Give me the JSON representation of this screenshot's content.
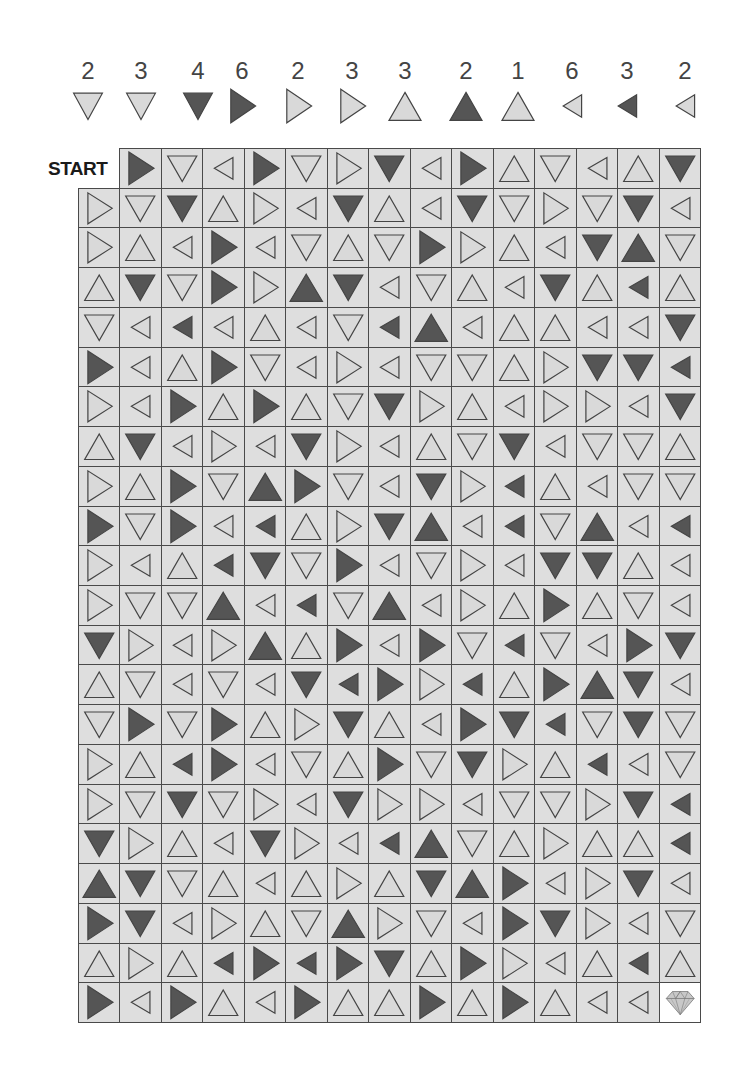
{
  "start_label": "START",
  "colors": {
    "light": "#d9d9d9",
    "dark": "#555555",
    "stroke": "#444444",
    "cell_bg": "#dedede",
    "grid_line": "#4a4a4a"
  },
  "legend": [
    {
      "count": "2",
      "dir": "D",
      "shade": "light"
    },
    {
      "count": "3",
      "dir": "D",
      "shade": "light"
    },
    {
      "count": "4",
      "dir": "D",
      "shade": "dark"
    },
    {
      "count": "6",
      "dir": "R",
      "shade": "dark"
    },
    {
      "count": "2",
      "dir": "R",
      "shade": "light"
    },
    {
      "count": "3",
      "dir": "R",
      "shade": "light"
    },
    {
      "count": "3",
      "dir": "U",
      "shade": "light"
    },
    {
      "count": "2",
      "dir": "U",
      "shade": "dark"
    },
    {
      "count": "1",
      "dir": "U",
      "shade": "light"
    },
    {
      "count": "6",
      "dir": "L",
      "shade": "light"
    },
    {
      "count": "3",
      "dir": "L",
      "shade": "dark"
    },
    {
      "count": "2",
      "dir": "L",
      "shade": "light"
    }
  ],
  "grid": {
    "columns": 15,
    "rows": [
      [
        "_",
        "Rd",
        "Dl",
        "Ll",
        "Rd",
        "Dl",
        "Rl",
        "Dd",
        "Ll",
        "Rd",
        "Ul",
        "Dl",
        "Ll",
        "Ul",
        "Dd"
      ],
      [
        "Rl",
        "Dl",
        "Dd",
        "Ul",
        "Rl",
        "Ll",
        "Dd",
        "Ul",
        "Ll",
        "Dd",
        "Dl",
        "Rl",
        "Dl",
        "Dd",
        "Ll"
      ],
      [
        "Rl",
        "Ul",
        "Ll",
        "Rd",
        "Ll",
        "Dl",
        "Ul",
        "Dl",
        "Rd",
        "Rl",
        "Ul",
        "Ll",
        "Dd",
        "Ud",
        "Dl"
      ],
      [
        "Ul",
        "Dd",
        "Dl",
        "Rd",
        "Rl",
        "Ud",
        "Dd",
        "Ll",
        "Dl",
        "Ul",
        "Ll",
        "Dd",
        "Ul",
        "Ld",
        "Ul"
      ],
      [
        "Dl",
        "Ll",
        "Ld",
        "Ll",
        "Ul",
        "Ll",
        "Dl",
        "Ld",
        "Ud",
        "Ll",
        "Ul",
        "Ul",
        "Ll",
        "Ll",
        "Dd"
      ],
      [
        "Rd",
        "Ll",
        "Ul",
        "Rd",
        "Dl",
        "Ll",
        "Rl",
        "Ll",
        "Dl",
        "Dl",
        "Ul",
        "Rl",
        "Dd",
        "Dd",
        "Ld"
      ],
      [
        "Rl",
        "Ll",
        "Rd",
        "Ul",
        "Rd",
        "Ul",
        "Dl",
        "Dd",
        "Rl",
        "Ul",
        "Ll",
        "Rl",
        "Rl",
        "Ll",
        "Dd"
      ],
      [
        "Ul",
        "Dd",
        "Ll",
        "Rl",
        "Ll",
        "Dd",
        "Rl",
        "Ll",
        "Ul",
        "Dl",
        "Dd",
        "Ll",
        "Dl",
        "Dl",
        "Ul"
      ],
      [
        "Rl",
        "Ul",
        "Rd",
        "Dl",
        "Ud",
        "Rd",
        "Dl",
        "Ll",
        "Dd",
        "Rl",
        "Ld",
        "Ul",
        "Ll",
        "Dl",
        "Dl"
      ],
      [
        "Rd",
        "Dl",
        "Rd",
        "Ll",
        "Ld",
        "Ul",
        "Rl",
        "Dd",
        "Ud",
        "Ll",
        "Ld",
        "Dl",
        "Ud",
        "Ll",
        "Ld"
      ],
      [
        "Rl",
        "Ll",
        "Ul",
        "Ld",
        "Dd",
        "Dl",
        "Rd",
        "Ll",
        "Dl",
        "Rl",
        "Ll",
        "Dd",
        "Dd",
        "Ul",
        "Ll"
      ],
      [
        "Rl",
        "Dl",
        "Dl",
        "Ud",
        "Ll",
        "Ld",
        "Dl",
        "Ud",
        "Ll",
        "Rl",
        "Ul",
        "Rd",
        "Ul",
        "Dl",
        "Ll"
      ],
      [
        "Dd",
        "Rl",
        "Ll",
        "Rl",
        "Ud",
        "Ul",
        "Rd",
        "Ll",
        "Rd",
        "Dl",
        "Ld",
        "Dl",
        "Ll",
        "Rd",
        "Dd"
      ],
      [
        "Ul",
        "Dl",
        "Ll",
        "Dl",
        "Ll",
        "Dd",
        "Ld",
        "Rd",
        "Rl",
        "Ld",
        "Ul",
        "Rd",
        "Ud",
        "Dd",
        "Ll"
      ],
      [
        "Dl",
        "Rd",
        "Dl",
        "Rd",
        "Ul",
        "Rl",
        "Dd",
        "Ul",
        "Ll",
        "Rd",
        "Dd",
        "Ld",
        "Dl",
        "Dd",
        "Dl"
      ],
      [
        "Rl",
        "Ul",
        "Ld",
        "Rd",
        "Ll",
        "Dl",
        "Ul",
        "Rd",
        "Dl",
        "Dd",
        "Rl",
        "Ul",
        "Ld",
        "Ll",
        "Dl"
      ],
      [
        "Rl",
        "Dl",
        "Dd",
        "Dl",
        "Rl",
        "Ll",
        "Dd",
        "Rl",
        "Rl",
        "Ll",
        "Dl",
        "Dl",
        "Rl",
        "Dd",
        "Ld"
      ],
      [
        "Dd",
        "Rl",
        "Ul",
        "Ll",
        "Dd",
        "Rl",
        "Ll",
        "Ld",
        "Ud",
        "Dl",
        "Ul",
        "Rl",
        "Ul",
        "Ul",
        "Ld"
      ],
      [
        "Ud",
        "Dd",
        "Dl",
        "Ul",
        "Ll",
        "Ul",
        "Rl",
        "Ul",
        "Dd",
        "Ud",
        "Rd",
        "Ll",
        "Rl",
        "Dd",
        "Ll"
      ],
      [
        "Rd",
        "Dd",
        "Ll",
        "Rl",
        "Ul",
        "Dl",
        "Ud",
        "Rl",
        "Dl",
        "Ll",
        "Rd",
        "Dd",
        "Rl",
        "Ll",
        "Dl"
      ],
      [
        "Ul",
        "Rl",
        "Ul",
        "Ld",
        "Rd",
        "Ld",
        "Rd",
        "Dd",
        "Ul",
        "Rd",
        "Rl",
        "Ll",
        "Ul",
        "Ld",
        "Ul"
      ],
      [
        "Rd",
        "Ll",
        "Rd",
        "Ul",
        "Ll",
        "Rd",
        "Ul",
        "Ul",
        "Rd",
        "Ul",
        "Rd",
        "Ul",
        "Ll",
        "Ll",
        "GOAL"
      ]
    ]
  },
  "goal_icon": "diamond-icon"
}
